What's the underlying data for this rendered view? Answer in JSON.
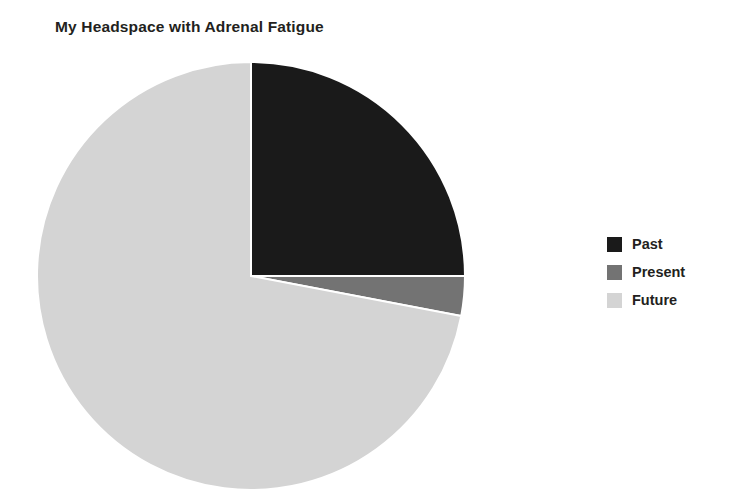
{
  "chart_data": {
    "type": "pie",
    "title": "My Headspace with Adrenal Fatigue",
    "categories": [
      "Past",
      "Present",
      "Future"
    ],
    "values": [
      25,
      3,
      72
    ],
    "units": "percent",
    "colors": [
      "#1a1a1a",
      "#737373",
      "#d4d4d4"
    ],
    "start_angle_deg": 0,
    "direction": "clockwise",
    "legend_position": "right",
    "grid": false,
    "xlabel": "",
    "ylabel": "",
    "slices": [
      {
        "label": "Past",
        "value": 25,
        "color": "#1a1a1a",
        "angle_deg": 90
      },
      {
        "label": "Present",
        "value": 3,
        "color": "#737373",
        "angle_deg": 10.8
      },
      {
        "label": "Future",
        "value": 72,
        "color": "#d4d4d4",
        "angle_deg": 259.2
      }
    ]
  },
  "figure": {
    "title": "My Headspace with Adrenal Fatigue",
    "background": "#ffffff"
  },
  "legend": {
    "items": [
      {
        "label": "Past",
        "color": "#1a1a1a"
      },
      {
        "label": "Present",
        "color": "#737373"
      },
      {
        "label": "Future",
        "color": "#d4d4d4"
      }
    ]
  }
}
